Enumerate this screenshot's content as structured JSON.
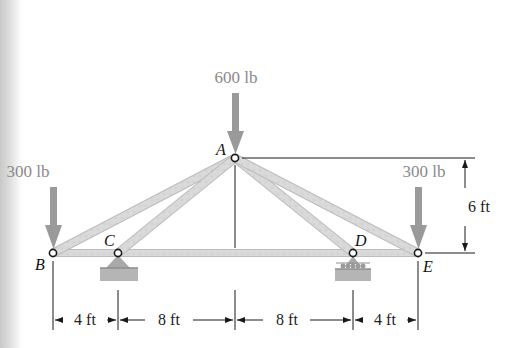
{
  "diagram": {
    "type": "truss-statics-problem",
    "joints": [
      {
        "id": "A",
        "label": "A",
        "x_ft": 12,
        "y_ft": 6
      },
      {
        "id": "B",
        "label": "B",
        "x_ft": 0,
        "y_ft": 0
      },
      {
        "id": "C",
        "label": "C",
        "x_ft": 4,
        "y_ft": 0
      },
      {
        "id": "D",
        "label": "D",
        "x_ft": 20,
        "y_ft": 0
      },
      {
        "id": "E",
        "label": "E",
        "x_ft": 24,
        "y_ft": 0
      }
    ],
    "members": [
      "AB",
      "AC",
      "AD",
      "AE",
      "BC",
      "CD",
      "DE"
    ],
    "supports": [
      {
        "joint": "C",
        "type": "pin"
      },
      {
        "joint": "D",
        "type": "roller"
      }
    ],
    "loads": [
      {
        "joint": "A",
        "label": "600 lb",
        "direction": "down"
      },
      {
        "joint": "B",
        "label": "300 lb",
        "direction": "down"
      },
      {
        "joint": "E",
        "label": "300 lb",
        "direction": "down"
      }
    ],
    "dimensions": {
      "horizontal": [
        "4 ft",
        "8 ft",
        "8 ft",
        "4 ft"
      ],
      "vertical": "6 ft"
    },
    "colors": {
      "member_fill": "#d6d6d6",
      "member_edge": "#b8b8b8",
      "load_arrow": "#9a9a9a",
      "support": "#a8a8a8",
      "line": "#1a1a1a"
    }
  }
}
